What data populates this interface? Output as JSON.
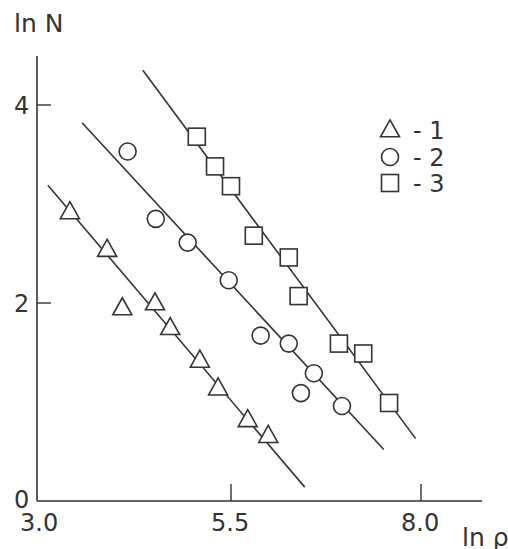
{
  "chart_data": {
    "type": "scatter",
    "title": "",
    "xlabel": "ln ρ",
    "ylabel": "ln N",
    "xlim": [
      3.0,
      8.7
    ],
    "ylim": [
      0,
      4.6
    ],
    "xticks": [
      3.0,
      5.5,
      8.0
    ],
    "xtick_labels": [
      "3.0",
      "5.5",
      "8.0"
    ],
    "yticks": [
      0,
      2,
      4
    ],
    "ytick_labels": [
      "0",
      "2",
      "4"
    ],
    "grid": false,
    "legend_position": "upper right",
    "series": [
      {
        "name": "1",
        "legend_label": "- 1",
        "marker": "triangle",
        "points": [
          [
            3.38,
            2.92
          ],
          [
            3.87,
            2.54
          ],
          [
            4.07,
            1.95
          ],
          [
            4.5,
            2.0
          ],
          [
            4.7,
            1.75
          ],
          [
            5.09,
            1.42
          ],
          [
            5.33,
            1.14
          ],
          [
            5.72,
            0.82
          ],
          [
            5.99,
            0.66
          ]
        ],
        "fit_line": [
          [
            3.09,
            3.19
          ],
          [
            6.47,
            0.14
          ]
        ]
      },
      {
        "name": "2",
        "legend_label": "- 2",
        "marker": "circle",
        "points": [
          [
            4.14,
            3.53
          ],
          [
            4.51,
            2.85
          ],
          [
            4.93,
            2.61
          ],
          [
            5.47,
            2.23
          ],
          [
            5.89,
            1.67
          ],
          [
            6.26,
            1.59
          ],
          [
            6.59,
            1.29
          ],
          [
            6.42,
            1.09
          ],
          [
            6.96,
            0.96
          ]
        ],
        "fit_line": [
          [
            3.54,
            3.82
          ],
          [
            7.51,
            0.52
          ]
        ]
      },
      {
        "name": "3",
        "legend_label": "- 3",
        "marker": "square",
        "points": [
          [
            5.05,
            3.68
          ],
          [
            5.29,
            3.38
          ],
          [
            5.5,
            3.18
          ],
          [
            5.8,
            2.68
          ],
          [
            6.26,
            2.46
          ],
          [
            6.39,
            2.07
          ],
          [
            6.92,
            1.59
          ],
          [
            7.24,
            1.49
          ],
          [
            7.58,
            0.99
          ]
        ],
        "fit_line": [
          [
            4.34,
            4.35
          ],
          [
            7.93,
            0.63
          ]
        ]
      }
    ]
  },
  "colors": {
    "ink": "#333333",
    "background": "#ffffff"
  }
}
